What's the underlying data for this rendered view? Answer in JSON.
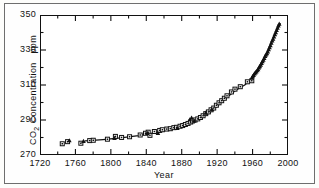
{
  "figure": {
    "background_color": "#fefefe",
    "frame_color": "#111111"
  },
  "chart_data": {
    "type": "scatter",
    "title": "",
    "xlabel": "Year",
    "ylabel": "CO2 Concentration",
    "yunit": "ppm",
    "ylabel_full": "CO₂ Concentration   ppm",
    "xlim": [
      1720,
      2000
    ],
    "ylim": [
      270,
      350
    ],
    "xticks": [
      1720,
      1760,
      1800,
      1840,
      1880,
      1920,
      1960,
      2000
    ],
    "xtick_labels": [
      "1720",
      "1760",
      "1800",
      "1840",
      "1880",
      "1920",
      "1960",
      "2000"
    ],
    "xminor_step": 20,
    "yticks": [
      270,
      290,
      310,
      330,
      350
    ],
    "ytick_labels": [
      "270",
      "290",
      "310",
      "330",
      "350"
    ],
    "yminor_step": 10,
    "grid": false,
    "legend": "none",
    "ticks_direction": "in",
    "series": [
      {
        "name": "Ice core (squares)",
        "marker": "open-square",
        "color": "#111111",
        "points": [
          [
            1744,
            277.0
          ],
          [
            1750,
            278.2
          ],
          [
            1765,
            277.3
          ],
          [
            1775,
            278.8
          ],
          [
            1779,
            279.0
          ],
          [
            1795,
            279.6
          ],
          [
            1804,
            281.2
          ],
          [
            1811,
            280.6
          ],
          [
            1820,
            281.0
          ],
          [
            1832,
            282.0
          ],
          [
            1838,
            283.0
          ],
          [
            1841,
            283.6
          ],
          [
            1843,
            281.8
          ],
          [
            1848,
            284.0
          ],
          [
            1854,
            284.6
          ],
          [
            1857,
            285.0
          ],
          [
            1862,
            285.4
          ],
          [
            1866,
            285.6
          ],
          [
            1870,
            286.2
          ],
          [
            1873,
            286.4
          ],
          [
            1877,
            287.0
          ],
          [
            1880,
            287.4
          ],
          [
            1883,
            288.0
          ],
          [
            1886,
            288.6
          ],
          [
            1889,
            289.4
          ],
          [
            1891,
            290.0
          ],
          [
            1894,
            290.6
          ],
          [
            1897,
            291.2
          ],
          [
            1900,
            292.0
          ],
          [
            1903,
            293.0
          ],
          [
            1906,
            294.2
          ],
          [
            1909,
            295.2
          ],
          [
            1912,
            296.4
          ],
          [
            1915,
            297.4
          ],
          [
            1918,
            299.0
          ],
          [
            1921,
            300.4
          ],
          [
            1924,
            301.6
          ],
          [
            1927,
            303.0
          ],
          [
            1930,
            304.4
          ],
          [
            1935,
            306.6
          ],
          [
            1939,
            308.2
          ],
          [
            1945,
            309.6
          ],
          [
            1953,
            312.4
          ],
          [
            1958,
            313.0
          ]
        ]
      },
      {
        "name": "Atmospheric record (triangles)",
        "marker": "filled-triangle",
        "color": "#111111",
        "points": [
          [
            1752,
            279.0
          ],
          [
            1768,
            278.6
          ],
          [
            1803,
            280.4
          ],
          [
            1840,
            283.2
          ],
          [
            1852,
            283.2
          ],
          [
            1874,
            286.0
          ],
          [
            1888,
            291.0
          ],
          [
            1890,
            292.0
          ],
          [
            1893,
            290.2
          ],
          [
            1906,
            294.8
          ],
          [
            1913,
            296.8
          ],
          [
            1958,
            314.8
          ],
          [
            1959,
            315.6
          ],
          [
            1960,
            316.4
          ],
          [
            1961,
            317.2
          ],
          [
            1962,
            317.8
          ],
          [
            1963,
            318.4
          ],
          [
            1964,
            319.0
          ],
          [
            1965,
            319.6
          ],
          [
            1966,
            320.6
          ],
          [
            1967,
            321.4
          ],
          [
            1968,
            322.2
          ],
          [
            1969,
            323.2
          ],
          [
            1970,
            324.2
          ],
          [
            1971,
            325.0
          ],
          [
            1972,
            326.0
          ],
          [
            1973,
            327.2
          ],
          [
            1974,
            328.0
          ],
          [
            1975,
            328.8
          ],
          [
            1976,
            329.8
          ],
          [
            1977,
            331.0
          ],
          [
            1978,
            332.2
          ],
          [
            1979,
            333.4
          ],
          [
            1980,
            334.8
          ],
          [
            1981,
            336.0
          ],
          [
            1982,
            337.0
          ],
          [
            1983,
            338.4
          ],
          [
            1984,
            339.6
          ],
          [
            1985,
            340.8
          ],
          [
            1986,
            342.0
          ],
          [
            1987,
            343.4
          ],
          [
            1988,
            344.6
          ],
          [
            1989,
            345.6
          ]
        ]
      }
    ],
    "fit_curve": {
      "name": "smooth trend line",
      "color": "#111111",
      "points": [
        [
          1770,
          278.6
        ],
        [
          1790,
          279.4
        ],
        [
          1810,
          280.4
        ],
        [
          1830,
          281.6
        ],
        [
          1850,
          283.4
        ],
        [
          1870,
          285.6
        ],
        [
          1885,
          288.0
        ],
        [
          1900,
          291.4
        ],
        [
          1910,
          294.6
        ],
        [
          1920,
          299.0
        ],
        [
          1930,
          303.6
        ],
        [
          1940,
          307.6
        ],
        [
          1950,
          310.6
        ],
        [
          1958,
          314.0
        ],
        [
          1965,
          319.4
        ],
        [
          1972,
          325.6
        ],
        [
          1980,
          334.4
        ],
        [
          1986,
          341.6
        ],
        [
          1990,
          345.6
        ]
      ]
    }
  }
}
